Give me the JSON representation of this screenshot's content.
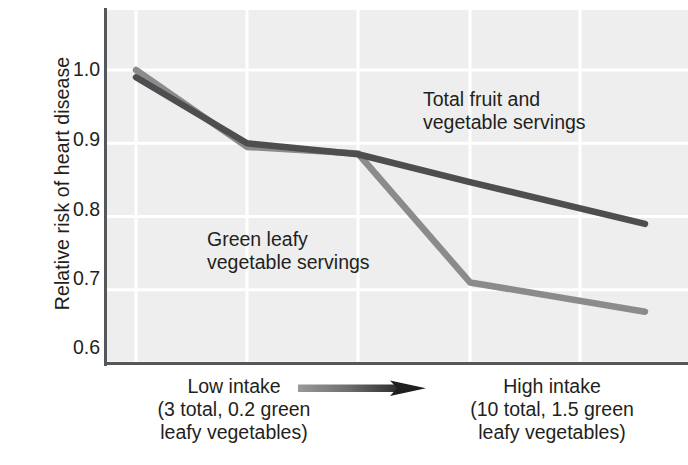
{
  "chart_data": {
    "type": "line",
    "title": "",
    "subtitle": "",
    "xlabel": "",
    "ylabel": "Relative risk of heart disease",
    "ylim": [
      0.6,
      1.0
    ],
    "yticks": [
      "1.0",
      "0.9",
      "0.8",
      "0.7",
      "0.6"
    ],
    "ytick_values": [
      1.0,
      0.9,
      0.8,
      0.7,
      0.6
    ],
    "grid": true,
    "grid_color": "#ffffff",
    "plot_background": "#eeeeee",
    "legend_position": "inline-annotations",
    "x": [
      1,
      2,
      3,
      4,
      5
    ],
    "xtick_labels": [
      "",
      "",
      "",
      "",
      ""
    ],
    "series": [
      {
        "name": "Total fruit and vegetable servings",
        "color": "#4e4e50",
        "values": [
          0.99,
          0.9,
          0.885,
          0.847,
          0.79
        ]
      },
      {
        "name": "Green leafy vegetable servings",
        "color": "#8b8b8d",
        "values": [
          1.0,
          0.895,
          0.886,
          0.71,
          0.67
        ]
      }
    ],
    "annotations": [
      {
        "id": "total-fruit-and-vegetable",
        "text": "Total fruit and\nvegetable servings"
      },
      {
        "id": "green-leafy-vegetable",
        "text": "Green leafy\nvegetable servings"
      }
    ],
    "x_axis_captions": {
      "low": "Low intake\n(3 total, 0.2 green\nleafy vegetables)",
      "high": "High intake\n(10 total, 1.5 green\nleafy vegetables)",
      "arrow": "intake-increasing-arrow"
    }
  }
}
